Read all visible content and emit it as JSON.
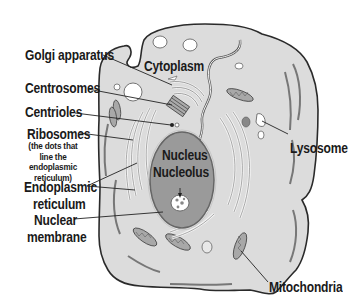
{
  "diagram": {
    "colors": {
      "cytoplasm": "#dcdcdc",
      "outline": "#2a2a2a",
      "nucleus": "#9a9a9a",
      "organelle": "#b4b4b4",
      "text": "#1a1a1a",
      "background": "#ffffff"
    },
    "labels": {
      "golgi": "Golgi apparatus",
      "cytoplasm": "Cytoplasm",
      "centrosomes": "Centrosomes",
      "centrioles": "Centrioles",
      "ribosomes": "Ribosomes",
      "ribosomes_note_1": "(the dots that",
      "ribosomes_note_2": "line the",
      "ribosomes_note_3": "endoplasmic",
      "ribosomes_note_4": "reticulum)",
      "er_1": "Endoplasmic",
      "er_2": "reticulum",
      "nuclear_membrane_1": "Nuclear",
      "nuclear_membrane_2": "membrane",
      "nucleus": "Nucleus",
      "nucleolus": "Nucleolus",
      "lysosome": "Lysosome",
      "mitochondria": "Mitochondria"
    }
  }
}
